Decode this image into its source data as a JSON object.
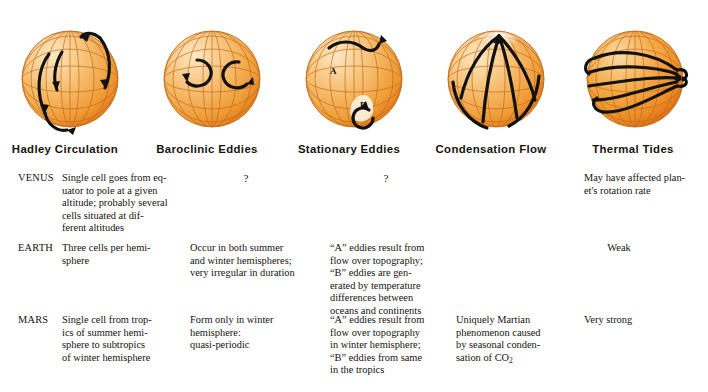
{
  "figure": {
    "caption_row_labels": [
      "VENUS",
      "EARTH",
      "MARS"
    ],
    "globes": [
      {
        "name": "hadley-circulation-globe",
        "label": "Hadley Circulation",
        "icon": "sphere-with-meridians-and-looping-arrows",
        "sphere_light": "#fbe0b0",
        "sphere_mid": "#f0a council",
        "arrow_color": "#141414"
      },
      {
        "name": "baroclinic-eddies-globe",
        "label": "Baroclinic Eddies",
        "icon": "sphere-with-two-circular-eddy-arrows",
        "arrow_color": "#141414"
      },
      {
        "name": "stationary-eddies-globe",
        "label": "Stationary Eddies",
        "icon": "sphere-with-labeled-A-and-B-eddies",
        "marker_a": "A",
        "marker_b": "B",
        "arrow_color": "#141414"
      },
      {
        "name": "condensation-flow-globe",
        "label": "Condensation Flow",
        "icon": "sphere-with-meridional-flow-to-pole",
        "arrow_color": "#141414"
      },
      {
        "name": "thermal-tides-globe",
        "label": "Thermal Tides",
        "icon": "sphere-with-zonal-bands-converging",
        "arrow_color": "#141414"
      }
    ],
    "palette": {
      "sphere_highlight": "#fde3b4",
      "sphere_body": "#f3a23c",
      "sphere_deep": "#e4701d",
      "grid_line": "#c06a18",
      "arrow": "#111111",
      "text": "#16120f"
    }
  },
  "columns": [
    {
      "key": "hadley",
      "label": "Hadley Circulation"
    },
    {
      "key": "baroclinic",
      "label": "Baroclinic Eddies"
    },
    {
      "key": "stationary",
      "label": "Stationary Eddies"
    },
    {
      "key": "condensation",
      "label": "Condensation Flow"
    },
    {
      "key": "thermal",
      "label": "Thermal Tides"
    }
  ],
  "rows": [
    {
      "planet": "VENUS",
      "hadley": "Single cell goes from eq-\nuator to pole at a given\naltitude; probably several\ncells situated at dif-\nferent altitudes",
      "baroclinic": "?",
      "stationary": "?",
      "condensation": "",
      "thermal": "May have affected plan-\net's rotation rate"
    },
    {
      "planet": "EARTH",
      "hadley": "Three cells per hemi-\nsphere",
      "baroclinic": "Occur in both summer\nand winter hemispheres;\nvery irregular in duration",
      "stationary": "“A” eddies result from\nflow over topography;\n“B” eddies are gen-\nerated by temperature\ndifferences between\noceans and continents",
      "condensation": "",
      "thermal": "Weak"
    },
    {
      "planet": "MARS",
      "hadley": "Single cell from trop-\nics of summer hemi-\nsphere to subtropics\nof winter hemisphere",
      "baroclinic": "Form only in winter\nhemisphere:\nquasi-periodic",
      "stationary": "“A” eddies result from\nflow over topography\nin winter hemisphere;\n“B” eddies from same\nin the tropics",
      "condensation_line1": "Uniquely Martian",
      "condensation_line2": "phenomenon caused",
      "condensation_line3": "by seasonal conden-",
      "condensation_line4_prefix": "sation of CO",
      "condensation_line4_sub": "2",
      "thermal": "Very strong"
    }
  ]
}
